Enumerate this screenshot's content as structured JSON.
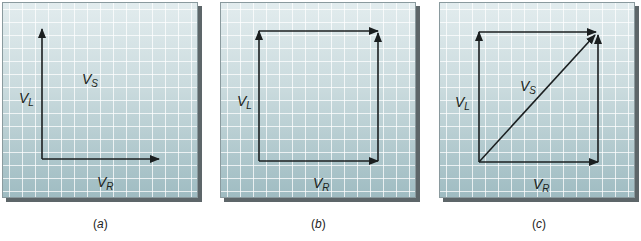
{
  "figure": {
    "panels": [
      {
        "id": "a",
        "caption": "(a)",
        "caption_letter": "a",
        "labels": {
          "vl": "V",
          "vl_sub": "L",
          "vs": "V",
          "vs_sub": "S",
          "vr": "V",
          "vr_sub": "R"
        },
        "vectors": [
          "V_L (vertical, up)",
          "V_R (horizontal, right)"
        ]
      },
      {
        "id": "b",
        "caption": "(b)",
        "caption_letter": "b",
        "labels": {
          "vl": "V",
          "vl_sub": "L",
          "vr": "V",
          "vr_sub": "R"
        },
        "vectors": [
          "V_L (vertical, up)",
          "V_R (horizontal, right)",
          "V_L translated to tip of V_R",
          "V_R translated to tip of V_L"
        ]
      },
      {
        "id": "c",
        "caption": "(c)",
        "caption_letter": "c",
        "labels": {
          "vl": "V",
          "vl_sub": "L",
          "vs": "V",
          "vs_sub": "S",
          "vr": "V",
          "vr_sub": "R"
        },
        "vectors": [
          "V_L (vertical, up)",
          "V_R (horizontal, right)",
          "parallelogram sides",
          "V_S (diagonal resultant)"
        ]
      }
    ],
    "colors": {
      "grid_top": "#e2ecee",
      "grid_bottom": "#9fbcc2",
      "grid_line": "#ffffff",
      "arrow": "#1b1f20",
      "shadow": "#5d6669"
    }
  }
}
